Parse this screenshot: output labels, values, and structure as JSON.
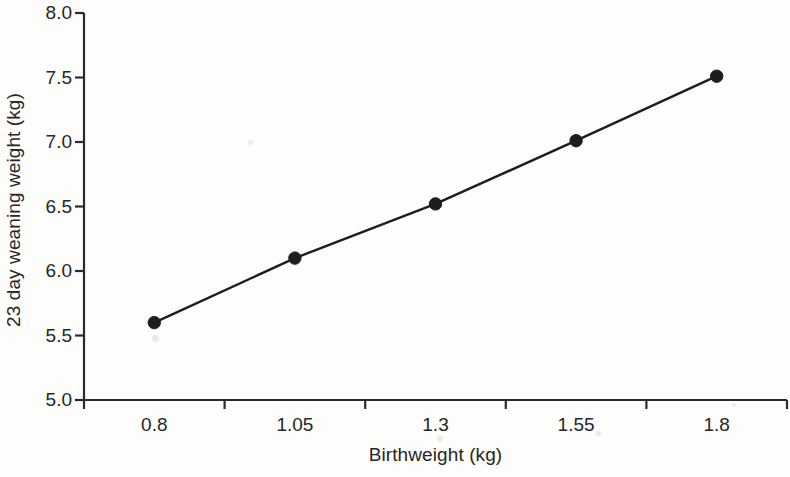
{
  "chart_data": {
    "type": "line",
    "title": "",
    "xlabel": "Birthweight (kg)",
    "ylabel": "23 day weaning weight (kg)",
    "categories": [
      "0.8",
      "1.05",
      "1.3",
      "1.55",
      "1.8"
    ],
    "x": [
      0.8,
      1.05,
      1.3,
      1.55,
      1.8
    ],
    "values": [
      5.6,
      6.1,
      6.52,
      7.01,
      7.51
    ],
    "series": [
      {
        "name": "23 day weaning weight",
        "values": [
          5.6,
          6.1,
          6.52,
          7.01,
          7.51
        ]
      }
    ],
    "ylim": [
      5.0,
      8.0
    ],
    "yticks": [
      "5.0",
      "5.5",
      "6.0",
      "6.5",
      "7.0",
      "7.5",
      "8.0"
    ],
    "ytick_values": [
      5.0,
      5.5,
      6.0,
      6.5,
      7.0,
      7.5,
      8.0
    ],
    "xticks": [
      "0.8",
      "1.05",
      "1.3",
      "1.55",
      "1.8"
    ],
    "grid": false,
    "legend": false,
    "legend_position": "none",
    "marker": "filled-circle",
    "line_color": "#1d1d1d",
    "marker_color": "#1d1d1d",
    "background_color": "#fdfdfc",
    "axis_color": "#2b2b2b"
  },
  "axis_titles": {
    "x": "Birthweight (kg)",
    "y": "23 day weaning weight (kg)"
  }
}
